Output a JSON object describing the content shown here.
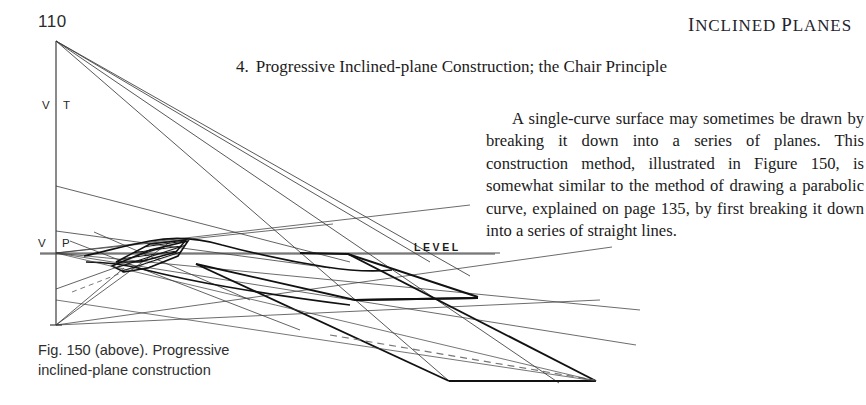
{
  "page": {
    "number": "110",
    "running_head": "Inclined Planes"
  },
  "section": {
    "number": "4.",
    "title": "Progressive Inclined-plane Construction; the Chair Principle"
  },
  "body": {
    "paragraph": "A single-curve surface may sometimes be drawn by breaking it down into a series of planes. This construction method, illustrated in Figure 150, is somewhat similar to the method of drawing a parabolic curve, explained on page 135, by first breaking it down into a series of straight lines."
  },
  "caption": {
    "line1": "Fig. 150 (above). Progressive",
    "line2": "inclined-plane construction"
  },
  "diagram": {
    "labels": {
      "vt_v": "V",
      "vt_t": "T",
      "vp_v": "V",
      "vp_p": "P",
      "level": "LEVEL"
    },
    "colors": {
      "ink": "#1a1a1a",
      "thin_ink": "#3a3a3a",
      "paper": "#ffffff"
    }
  }
}
